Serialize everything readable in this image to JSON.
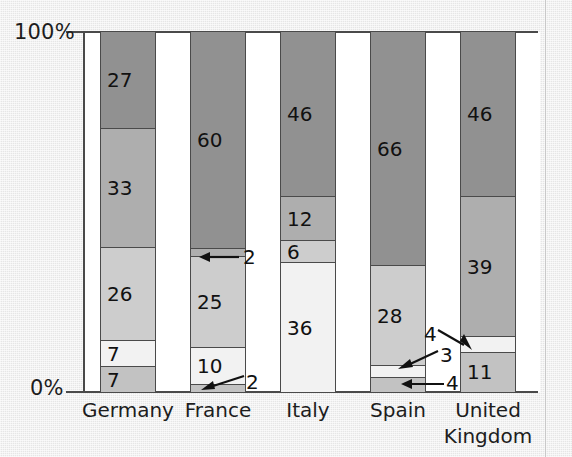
{
  "chart_data": {
    "type": "bar",
    "subtype": "stacked-100-percent",
    "title": "",
    "xlabel": "",
    "ylabel": "",
    "ylim": [
      0,
      100
    ],
    "ytick_labels": [
      "0%",
      "100%"
    ],
    "grid": false,
    "legend": "none",
    "categories": [
      "Germany",
      "France",
      "Italy",
      "Spain",
      "United\nKingdom"
    ],
    "series": [
      {
        "name": "segment-1-dark",
        "color": "#919191",
        "values": [
          27,
          60,
          46,
          66,
          46
        ]
      },
      {
        "name": "segment-2-medium",
        "color": "#aeaeae",
        "values": [
          33,
          2,
          12,
          null,
          39
        ]
      },
      {
        "name": "segment-3-light",
        "color": "#cdcdcd",
        "values": [
          26,
          25,
          6,
          28,
          null
        ]
      },
      {
        "name": "segment-4-pale",
        "color": "#f2f2f2",
        "values": [
          7,
          10,
          36,
          3,
          4
        ]
      },
      {
        "name": "segment-5-lightgray",
        "color": "#c2c2c2",
        "values": [
          7,
          2,
          null,
          4,
          11
        ]
      }
    ],
    "bars": [
      {
        "category": "Germany",
        "segments": [
          {
            "value": 27,
            "color": "#919191",
            "label_inside": true
          },
          {
            "value": 33,
            "color": "#aeaeae",
            "label_inside": true
          },
          {
            "value": 26,
            "color": "#cdcdcd",
            "label_inside": true
          },
          {
            "value": 7,
            "color": "#f2f2f2",
            "label_inside": true
          },
          {
            "value": 7,
            "color": "#c2c2c2",
            "label_inside": true
          }
        ]
      },
      {
        "category": "France",
        "segments": [
          {
            "value": 60,
            "color": "#919191",
            "label_inside": true
          },
          {
            "value": 2,
            "color": "#aeaeae",
            "label_inside": false
          },
          {
            "value": 25,
            "color": "#cdcdcd",
            "label_inside": true
          },
          {
            "value": 10,
            "color": "#f2f2f2",
            "label_inside": true
          },
          {
            "value": 2,
            "color": "#c2c2c2",
            "label_inside": false
          }
        ]
      },
      {
        "category": "Italy",
        "segments": [
          {
            "value": 46,
            "color": "#919191",
            "label_inside": true
          },
          {
            "value": 12,
            "color": "#aeaeae",
            "label_inside": true
          },
          {
            "value": 6,
            "color": "#cdcdcd",
            "label_inside": true
          },
          {
            "value": 36,
            "color": "#f2f2f2",
            "label_inside": true
          }
        ]
      },
      {
        "category": "Spain",
        "segments": [
          {
            "value": 66,
            "color": "#919191",
            "label_inside": true
          },
          {
            "value": 28,
            "color": "#cdcdcd",
            "label_inside": true
          },
          {
            "value": 3,
            "color": "#f2f2f2",
            "label_inside": false
          },
          {
            "value": 4,
            "color": "#c2c2c2",
            "label_inside": false
          }
        ]
      },
      {
        "category": "United Kingdom",
        "segments": [
          {
            "value": 46,
            "color": "#919191",
            "label_inside": true
          },
          {
            "value": 39,
            "color": "#aeaeae",
            "label_inside": true
          },
          {
            "value": 4,
            "color": "#f2f2f2",
            "label_inside": false
          },
          {
            "value": 11,
            "color": "#c2c2c2",
            "label_inside": true
          }
        ]
      }
    ],
    "annotations": [
      {
        "text": "2",
        "points_to": "France segment 2 (value 2)"
      },
      {
        "text": "2",
        "points_to": "France segment 5 (value 2)"
      },
      {
        "text": "3",
        "points_to": "Spain segment 3 (value 3)"
      },
      {
        "text": "4",
        "points_to": "Spain segment 4 (value 4)"
      },
      {
        "text": "4",
        "points_to": "United Kingdom segment 3 (value 4)"
      }
    ]
  },
  "axis": {
    "y_top_label": "100%",
    "y_bottom_label": "0%"
  },
  "categories": {
    "germany": "Germany",
    "france": "France",
    "italy": "Italy",
    "spain": "Spain",
    "uk_line1": "United",
    "uk_line2": "Kingdom"
  },
  "annotation_labels": {
    "france_top": "2",
    "france_bottom": "2",
    "spain_upper": "3",
    "spain_lower": "4",
    "uk": "4"
  }
}
